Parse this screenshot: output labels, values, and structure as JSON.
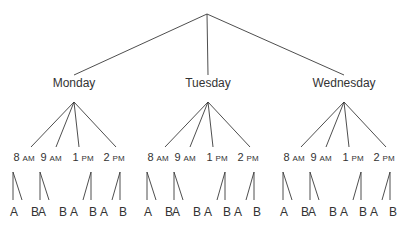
{
  "diagram": {
    "type": "tree",
    "root": "",
    "days": [
      {
        "label": "Monday",
        "times": [
          {
            "hour": "8",
            "period": "AM",
            "choices": [
              "A",
              "B"
            ]
          },
          {
            "hour": "9",
            "period": "AM",
            "choices": [
              "A",
              "B"
            ]
          },
          {
            "hour": "1",
            "period": "PM",
            "choices": [
              "A",
              "B"
            ]
          },
          {
            "hour": "2",
            "period": "PM",
            "choices": [
              "A",
              "B"
            ]
          }
        ]
      },
      {
        "label": "Tuesday",
        "times": [
          {
            "hour": "8",
            "period": "AM",
            "choices": [
              "A",
              "B"
            ]
          },
          {
            "hour": "9",
            "period": "AM",
            "choices": [
              "A",
              "B"
            ]
          },
          {
            "hour": "1",
            "period": "PM",
            "choices": [
              "A",
              "B"
            ]
          },
          {
            "hour": "2",
            "period": "PM",
            "choices": [
              "A",
              "B"
            ]
          }
        ]
      },
      {
        "label": "Wednesday",
        "times": [
          {
            "hour": "8",
            "period": "AM",
            "choices": [
              "A",
              "B"
            ]
          },
          {
            "hour": "9",
            "period": "AM",
            "choices": [
              "A",
              "B"
            ]
          },
          {
            "hour": "1",
            "period": "PM",
            "choices": [
              "A",
              "B"
            ]
          },
          {
            "hour": "2",
            "period": "PM",
            "choices": [
              "A",
              "B"
            ]
          }
        ]
      }
    ],
    "colors": {
      "line": "#3a3a3a",
      "text": "#333333",
      "background": "#ffffff"
    }
  }
}
